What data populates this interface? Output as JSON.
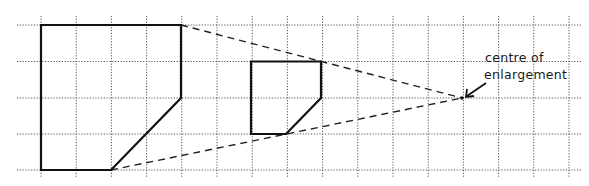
{
  "diagram": {
    "type": "enlargement-on-grid",
    "annotation": {
      "line1": "centre of",
      "line2": "enlargement"
    },
    "grid": {
      "x0": 41,
      "dx": 35.2,
      "cols": 16,
      "rows_y": [
        25,
        61.5,
        98,
        134,
        170
      ],
      "h_extent": [
        17,
        581
      ],
      "v_extent": [
        16,
        177
      ]
    },
    "centre_of_enlargement": {
      "x": 462,
      "y": 98
    },
    "large_shape": {
      "points": [
        [
          41,
          25
        ],
        [
          181,
          25
        ],
        [
          181,
          98
        ],
        [
          111,
          170
        ],
        [
          41,
          170
        ]
      ]
    },
    "small_shape": {
      "points": [
        [
          251,
          61.5
        ],
        [
          321,
          61.5
        ],
        [
          321,
          98
        ],
        [
          286,
          134
        ],
        [
          251,
          134
        ]
      ]
    },
    "ray_lines": [
      {
        "from": [
          181,
          25
        ],
        "to": [
          462,
          98
        ]
      },
      {
        "from": [
          111,
          170
        ],
        "to": [
          462,
          98
        ]
      }
    ],
    "colors": {
      "grid": "#555555",
      "shape": "#111111",
      "ray": "#222222"
    }
  }
}
